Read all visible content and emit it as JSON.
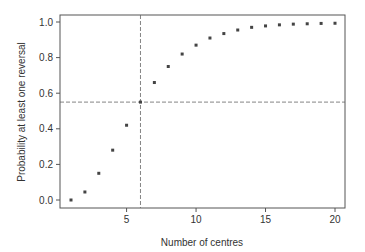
{
  "chart_data": {
    "type": "scatter",
    "title": "",
    "xlabel": "Number of centres",
    "ylabel": "Probability at least one reversal",
    "xlim": [
      0.3,
      20.7
    ],
    "ylim": [
      -0.04,
      1.04
    ],
    "xticks": [
      5,
      10,
      15,
      20
    ],
    "xtick_labels": [
      "5",
      "10",
      "15",
      "20"
    ],
    "yticks": [
      0.0,
      0.2,
      0.4,
      0.6,
      0.8,
      1.0
    ],
    "ytick_labels": [
      "0.0",
      "0.2",
      "0.4",
      "0.6",
      "0.8",
      "1.0"
    ],
    "grid": false,
    "legend": null,
    "series": [
      {
        "name": "Probability",
        "marker": "square",
        "x": [
          1,
          2,
          3,
          4,
          5,
          6,
          7,
          8,
          9,
          10,
          11,
          12,
          13,
          14,
          15,
          16,
          17,
          18,
          19,
          20
        ],
        "y": [
          0.0,
          0.045,
          0.15,
          0.28,
          0.42,
          0.55,
          0.66,
          0.75,
          0.82,
          0.87,
          0.91,
          0.935,
          0.955,
          0.97,
          0.978,
          0.984,
          0.988,
          0.99,
          0.992,
          0.993
        ]
      }
    ],
    "reference_lines": [
      {
        "orientation": "vertical",
        "x": 6,
        "style": "dashed"
      },
      {
        "orientation": "horizontal",
        "y": 0.55,
        "style": "dashed"
      }
    ]
  },
  "colors": {
    "axis": "#555555",
    "marker": "#444444",
    "reference_line": "#666666",
    "text": "#333333"
  }
}
